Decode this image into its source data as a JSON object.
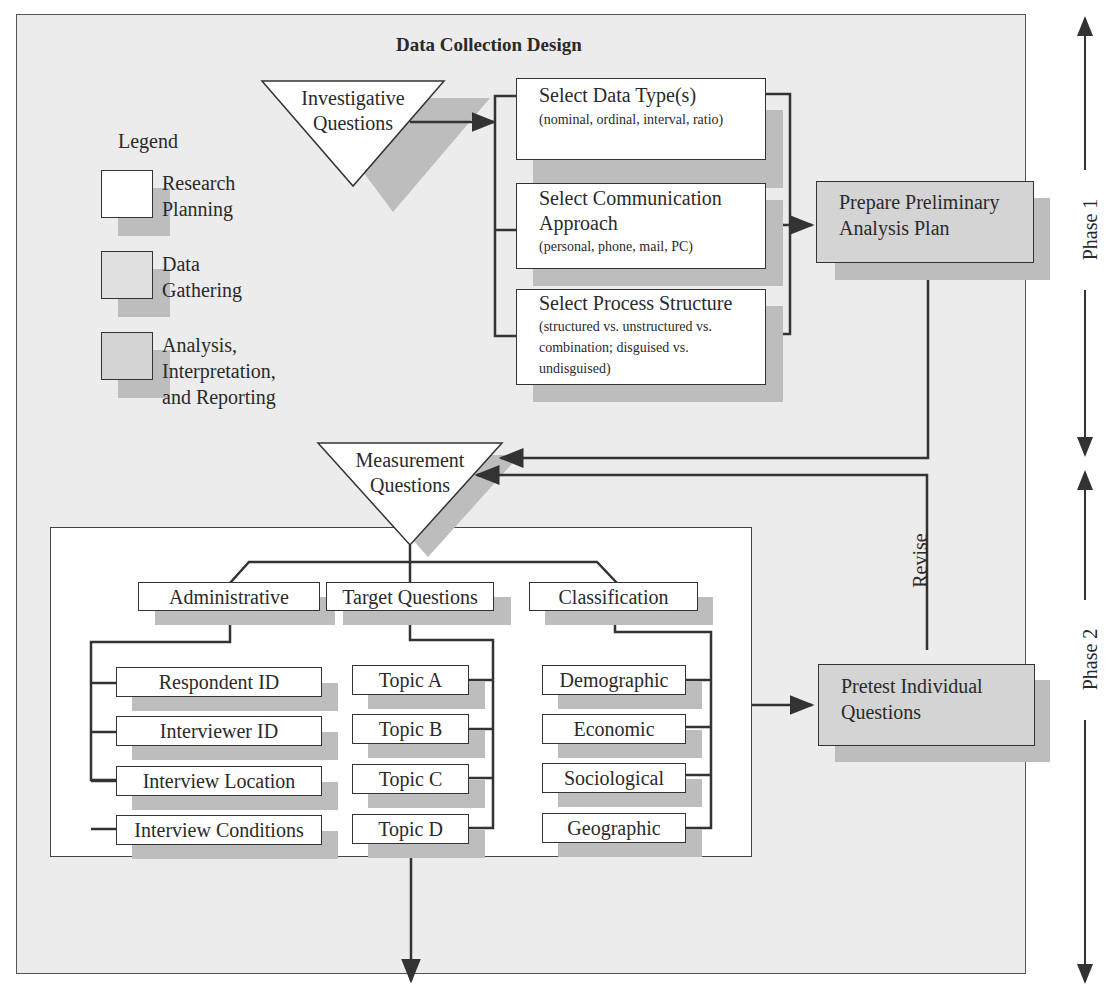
{
  "diagram": {
    "title": "Data Collection Design",
    "legend": {
      "heading": "Legend",
      "items": [
        {
          "label_line1": "Research",
          "label_line2": "Planning",
          "fill": "#ffffff"
        },
        {
          "label_line1": "Data",
          "label_line2": "Gathering",
          "fill": "#e0e0e0"
        },
        {
          "label_line1": "Analysis,",
          "label_line2": "Interpretation,",
          "label_line3": "and Reporting",
          "fill": "#d4d4d4"
        }
      ]
    },
    "investigative_questions": {
      "line1": "Investigative",
      "line2": "Questions"
    },
    "design_steps": [
      {
        "title": "Select Data Type(s)",
        "detail": "(nominal, ordinal, interval, ratio)"
      },
      {
        "title_line1": "Select Communication",
        "title_line2": "Approach",
        "detail": "(personal, phone, mail, PC)"
      },
      {
        "title": "Select Process Structure",
        "detail_line1": "(structured vs. unstructured vs.",
        "detail_line2": "combination; disguised vs.",
        "detail_line3": "undisguised)"
      }
    ],
    "analysis_plan": {
      "line1": "Prepare Preliminary",
      "line2": "Analysis Plan"
    },
    "measurement_questions": {
      "line1": "Measurement",
      "line2": "Questions"
    },
    "categories": [
      {
        "label": "Administrative",
        "items": [
          "Respondent ID",
          "Interviewer ID",
          "Interview Location",
          "Interview Conditions"
        ]
      },
      {
        "label": "Target Questions",
        "items": [
          "Topic A",
          "Topic B",
          "Topic C",
          "Topic D"
        ]
      },
      {
        "label": "Classification",
        "items": [
          "Demographic",
          "Economic",
          "Sociological",
          "Geographic"
        ]
      }
    ],
    "pretest": {
      "line1": "Pretest Individual",
      "line2": "Questions"
    },
    "revise_label": "Revise",
    "phases": [
      "Phase 1",
      "Phase 2"
    ]
  }
}
